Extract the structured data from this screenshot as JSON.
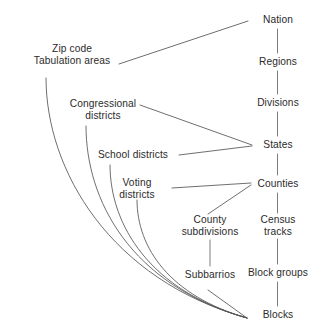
{
  "diagram": {
    "type": "hierarchy-diagram",
    "width": 327,
    "height": 332,
    "background_color": "#ffffff",
    "line_color": "#4a4a4a",
    "text_color": "#2b2b2b",
    "spine_nodes": [
      {
        "id": "nation",
        "label": "Nation",
        "x": 278,
        "y": 20
      },
      {
        "id": "regions",
        "label": "Regions",
        "x": 278,
        "y": 62
      },
      {
        "id": "divisions",
        "label": "Divisions",
        "x": 278,
        "y": 103
      },
      {
        "id": "states",
        "label": "States",
        "x": 278,
        "y": 145
      },
      {
        "id": "counties",
        "label": "Counties",
        "x": 278,
        "y": 184
      },
      {
        "id": "census-tracks",
        "label": "Census\ntracks",
        "x": 278,
        "y": 225
      },
      {
        "id": "block-groups",
        "label": "Block groups",
        "x": 278,
        "y": 273
      },
      {
        "id": "blocks",
        "label": "Blocks",
        "x": 278,
        "y": 315
      }
    ],
    "side_nodes": [
      {
        "id": "zcta",
        "label": "Zip code\nTabulation areas",
        "x": 72,
        "y": 55
      },
      {
        "id": "congressional",
        "label": "Congressional\ndistricts",
        "x": 103,
        "y": 110
      },
      {
        "id": "school-districts",
        "label": "School districts",
        "x": 133,
        "y": 155
      },
      {
        "id": "voting-districts",
        "label": "Voting\ndistricts",
        "x": 137,
        "y": 188
      },
      {
        "id": "county-subdivisions",
        "label": "County\nsubdivisions",
        "x": 210,
        "y": 225
      },
      {
        "id": "subbarrios",
        "label": "Subbarrios",
        "x": 210,
        "y": 275
      }
    ],
    "edges": [
      {
        "from": "nation",
        "to": "regions",
        "kind": "spine"
      },
      {
        "from": "regions",
        "to": "divisions",
        "kind": "spine"
      },
      {
        "from": "divisions",
        "to": "states",
        "kind": "spine"
      },
      {
        "from": "states",
        "to": "counties",
        "kind": "spine"
      },
      {
        "from": "counties",
        "to": "census-tracks",
        "kind": "spine"
      },
      {
        "from": "census-tracks",
        "to": "block-groups",
        "kind": "spine"
      },
      {
        "from": "block-groups",
        "to": "blocks",
        "kind": "spine"
      },
      {
        "from": "zcta",
        "to": "nation",
        "kind": "straight"
      },
      {
        "from": "congressional",
        "to": "states",
        "kind": "straight"
      },
      {
        "from": "school-districts",
        "to": "states",
        "kind": "straight"
      },
      {
        "from": "voting-districts",
        "to": "counties",
        "kind": "straight"
      },
      {
        "from": "county-subdivisions",
        "to": "counties",
        "kind": "straight"
      },
      {
        "from": "county-subdivisions",
        "to": "subbarrios",
        "kind": "straight"
      },
      {
        "from": "subbarrios",
        "to": "blocks",
        "kind": "straight"
      },
      {
        "from": "zcta",
        "to": "blocks",
        "kind": "curve"
      },
      {
        "from": "congressional",
        "to": "blocks",
        "kind": "curve"
      },
      {
        "from": "school-districts",
        "to": "blocks",
        "kind": "curve"
      },
      {
        "from": "voting-districts",
        "to": "blocks",
        "kind": "curve"
      }
    ]
  }
}
